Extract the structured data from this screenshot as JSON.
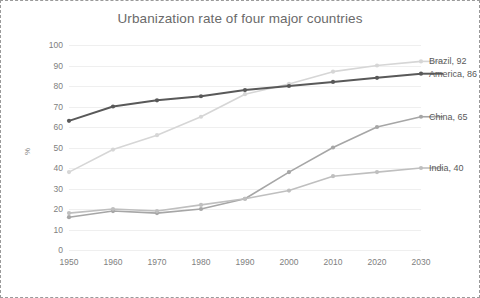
{
  "chart_data": {
    "type": "line",
    "title": "Urbanization rate of four major countries",
    "xlabel": "",
    "ylabel": "%",
    "x": [
      1950,
      1960,
      1970,
      1980,
      1990,
      2000,
      2010,
      2020,
      2030
    ],
    "xtick_labels": [
      "1950",
      "1960",
      "1970",
      "1980",
      "1990",
      "2000",
      "2010",
      "2020",
      "2030"
    ],
    "xlim": [
      1950,
      2030
    ],
    "ylim": [
      0,
      100
    ],
    "ytick_labels": [
      "100",
      "90",
      "80",
      "70",
      "60",
      "50",
      "40",
      "30",
      "20",
      "10",
      "0"
    ],
    "ytick_values": [
      100,
      90,
      80,
      70,
      60,
      50,
      40,
      30,
      20,
      10,
      0
    ],
    "grid": true,
    "grid_axis": "y",
    "legend_position": "end-of-line",
    "series": [
      {
        "name": "Brazil",
        "end_label": "Brazil, 92",
        "end_value": 92,
        "color": "#d6d6d6",
        "values": [
          38,
          49,
          56,
          65,
          76,
          81,
          87,
          90,
          92
        ]
      },
      {
        "name": "America",
        "end_label": "America, 86",
        "end_value": 86,
        "color": "#595959",
        "values": [
          63,
          70,
          73,
          75,
          78,
          80,
          82,
          84,
          86
        ]
      },
      {
        "name": "China",
        "end_label": "China, 65",
        "end_value": 65,
        "color": "#a6a6a6",
        "values": [
          16,
          19,
          18,
          20,
          25,
          38,
          50,
          60,
          65
        ]
      },
      {
        "name": "India",
        "end_label": "India, 40",
        "end_value": 40,
        "color": "#bfbfbf",
        "values": [
          18,
          20,
          19,
          22,
          25,
          29,
          36,
          38,
          40
        ]
      }
    ]
  },
  "style": {
    "title_color": "#6a6a6a",
    "tick_color": "#808080",
    "grid_color": "#efefef",
    "border_color": "#9a9a9a",
    "background": "#ffffff"
  }
}
